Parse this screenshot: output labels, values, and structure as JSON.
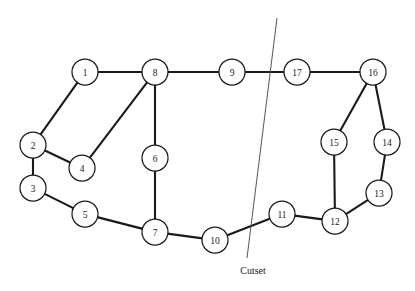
{
  "figure": {
    "title": "",
    "background_color": "#ffffff",
    "width": 415,
    "height": 291
  },
  "chart_data": {
    "type": "diagram",
    "diagram_kind": "undirected-graph-with-cutset",
    "title": "",
    "node_radius": 13,
    "node_fill": "#ffffff",
    "node_stroke": "#1a1a1a",
    "edge_color": "#1a1a1a",
    "cutset_color": "#555555",
    "nodes": [
      {
        "id": "1",
        "label": "1",
        "x": 85,
        "y": 72
      },
      {
        "id": "2",
        "label": "2",
        "x": 33,
        "y": 145
      },
      {
        "id": "3",
        "label": "3",
        "x": 33,
        "y": 188
      },
      {
        "id": "4",
        "label": "4",
        "x": 82,
        "y": 168
      },
      {
        "id": "5",
        "label": "5",
        "x": 85,
        "y": 214
      },
      {
        "id": "6",
        "label": "6",
        "x": 155,
        "y": 158
      },
      {
        "id": "7",
        "label": "7",
        "x": 155,
        "y": 232
      },
      {
        "id": "8",
        "label": "8",
        "x": 155,
        "y": 72
      },
      {
        "id": "9",
        "label": "9",
        "x": 232,
        "y": 72
      },
      {
        "id": "10",
        "label": "10",
        "x": 215,
        "y": 240
      },
      {
        "id": "11",
        "label": "11",
        "x": 282,
        "y": 214
      },
      {
        "id": "12",
        "label": "12",
        "x": 335,
        "y": 221
      },
      {
        "id": "13",
        "label": "13",
        "x": 379,
        "y": 193
      },
      {
        "id": "14",
        "label": "14",
        "x": 387,
        "y": 142
      },
      {
        "id": "15",
        "label": "15",
        "x": 334,
        "y": 142
      },
      {
        "id": "16",
        "label": "16",
        "x": 373,
        "y": 72
      },
      {
        "id": "17",
        "label": "17",
        "x": 297,
        "y": 72
      }
    ],
    "edges": [
      {
        "from": "1",
        "to": "2"
      },
      {
        "from": "1",
        "to": "8"
      },
      {
        "from": "2",
        "to": "3"
      },
      {
        "from": "2",
        "to": "4"
      },
      {
        "from": "3",
        "to": "5"
      },
      {
        "from": "4",
        "to": "8"
      },
      {
        "from": "5",
        "to": "7"
      },
      {
        "from": "6",
        "to": "7"
      },
      {
        "from": "6",
        "to": "8"
      },
      {
        "from": "7",
        "to": "10"
      },
      {
        "from": "8",
        "to": "9"
      },
      {
        "from": "9",
        "to": "17"
      },
      {
        "from": "10",
        "to": "11"
      },
      {
        "from": "11",
        "to": "12"
      },
      {
        "from": "12",
        "to": "13"
      },
      {
        "from": "12",
        "to": "15"
      },
      {
        "from": "13",
        "to": "14"
      },
      {
        "from": "14",
        "to": "16"
      },
      {
        "from": "15",
        "to": "16"
      },
      {
        "from": "16",
        "to": "17"
      }
    ],
    "cutset": {
      "label": "Cutset",
      "label_x": 253,
      "label_y": 270,
      "line": {
        "x1": 277,
        "y1": 18,
        "x2": 247,
        "y2": 258
      },
      "cut_edges": [
        "9-17",
        "10-11"
      ]
    }
  }
}
